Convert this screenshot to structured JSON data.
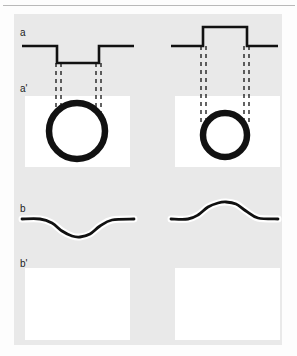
{
  "figure": {
    "canvas": {
      "width": 297,
      "height": 356,
      "background": "#fdfdfd"
    },
    "panel": {
      "x": 14,
      "y": 14,
      "width": 268,
      "height": 331,
      "background": "#e9e9e9"
    },
    "top_rule_color": "#b9b9b9",
    "ink_color": "#111111",
    "plot_background": "#ffffff",
    "columns": [
      "left",
      "right"
    ],
    "rows": [
      {
        "key": "a",
        "label": "a",
        "label_x": 20,
        "label_y": 28,
        "caption": "potential step profile"
      },
      {
        "key": "ap",
        "label": "a'",
        "label_x": 20,
        "label_y": 84,
        "caption": "ring / circular cross-section"
      },
      {
        "key": "b",
        "label": "b",
        "label_x": 20,
        "label_y": 204,
        "caption": "smooth potential profile"
      },
      {
        "key": "bp",
        "label": "b'",
        "label_x": 20,
        "label_y": 259,
        "caption": "empty panel"
      }
    ]
  },
  "chart_data": [
    {
      "id": "a-left",
      "row": "a",
      "column": "left",
      "type": "line",
      "title": "",
      "xlabel": "",
      "ylabel": "",
      "description": "square potential well: flat baseline, abrupt drop, flat bottom, abrupt rise back to baseline",
      "stroke_width": 2.6,
      "color": "#111111",
      "x": [
        22,
        57,
        57,
        99,
        99,
        134
      ],
      "y": [
        46,
        46,
        63,
        63,
        46,
        46
      ],
      "baseline_y": 46,
      "well_depth": 17,
      "edges_x": [
        57,
        99
      ],
      "guide_lines": [
        {
          "x": 56,
          "y0": 63,
          "y1": 118,
          "style": "dashed"
        },
        {
          "x": 61,
          "y0": 63,
          "y1": 118,
          "style": "dashed"
        },
        {
          "x": 96,
          "y0": 63,
          "y1": 118,
          "style": "dashed"
        },
        {
          "x": 101,
          "y0": 63,
          "y1": 118,
          "style": "dashed"
        }
      ]
    },
    {
      "id": "a-right",
      "row": "a",
      "column": "right",
      "type": "line",
      "title": "",
      "xlabel": "",
      "ylabel": "",
      "description": "square potential barrier: flat baseline, abrupt rise, flat top, abrupt fall back to baseline",
      "stroke_width": 2.6,
      "color": "#111111",
      "x": [
        171,
        203,
        203,
        247,
        247,
        278
      ],
      "y": [
        46,
        46,
        27,
        27,
        46,
        46
      ],
      "baseline_y": 46,
      "barrier_height": 19,
      "edges_x": [
        203,
        247
      ],
      "guide_lines": [
        {
          "x": 201,
          "y0": 46,
          "y1": 122,
          "style": "dashed"
        },
        {
          "x": 206,
          "y0": 46,
          "y1": 122,
          "style": "dashed"
        },
        {
          "x": 244,
          "y0": 46,
          "y1": 122,
          "style": "dashed"
        },
        {
          "x": 249,
          "y0": 46,
          "y1": 122,
          "style": "dashed"
        }
      ]
    },
    {
      "id": "ap-left",
      "row": "ap",
      "column": "left",
      "type": "scatter",
      "title": "",
      "description": "thick black ring (circle outline), large",
      "shape": "circle",
      "cx": 77,
      "cy": 131,
      "r": 28,
      "stroke_width": 6.5,
      "color": "#111111",
      "fill": "#ffffff",
      "plot_box": {
        "x": 25,
        "y": 96,
        "width": 105,
        "height": 71
      }
    },
    {
      "id": "ap-right",
      "row": "ap",
      "column": "right",
      "type": "scatter",
      "title": "",
      "description": "thick black ring (circle outline), smaller than left",
      "shape": "circle",
      "cx": 225,
      "cy": 135,
      "r": 22,
      "stroke_width": 6.5,
      "color": "#111111",
      "fill": "#ffffff",
      "plot_box": {
        "x": 175,
        "y": 96,
        "width": 105,
        "height": 71
      }
    },
    {
      "id": "b-left",
      "row": "b",
      "column": "left",
      "type": "line",
      "title": "",
      "xlabel": "",
      "ylabel": "",
      "description": "smoothed potential well: gentle sigmoid dip and return to baseline",
      "stroke_width": 2.8,
      "color": "#111111",
      "glow_color": "#ffffff",
      "glow_width": 7,
      "baseline_y": 219,
      "min_y": 237,
      "x": [
        22,
        40,
        52,
        62,
        72,
        80,
        90,
        100,
        112,
        134
      ],
      "y": [
        219,
        219,
        223,
        231,
        236,
        237,
        234,
        226,
        220,
        219
      ]
    },
    {
      "id": "b-right",
      "row": "b",
      "column": "right",
      "type": "line",
      "title": "",
      "xlabel": "",
      "ylabel": "",
      "description": "smoothed potential barrier: gentle sigmoid bump and return to baseline",
      "stroke_width": 2.8,
      "color": "#111111",
      "glow_color": "#ffffff",
      "glow_width": 7,
      "baseline_y": 219,
      "max_y": 202,
      "x": [
        171,
        188,
        198,
        208,
        218,
        226,
        236,
        246,
        258,
        278
      ],
      "y": [
        219,
        219,
        215,
        207,
        203,
        202,
        204,
        211,
        218,
        219
      ]
    },
    {
      "id": "bp-left",
      "row": "bp",
      "column": "left",
      "type": "line",
      "title": "",
      "description": "empty white plot panel, no data drawn",
      "plot_box": {
        "x": 25,
        "y": 268,
        "width": 105,
        "height": 72
      },
      "x": [],
      "y": []
    },
    {
      "id": "bp-right",
      "row": "bp",
      "column": "right",
      "type": "line",
      "title": "",
      "description": "empty white plot panel, no data drawn",
      "plot_box": {
        "x": 175,
        "y": 268,
        "width": 105,
        "height": 72
      },
      "x": [],
      "y": []
    }
  ]
}
